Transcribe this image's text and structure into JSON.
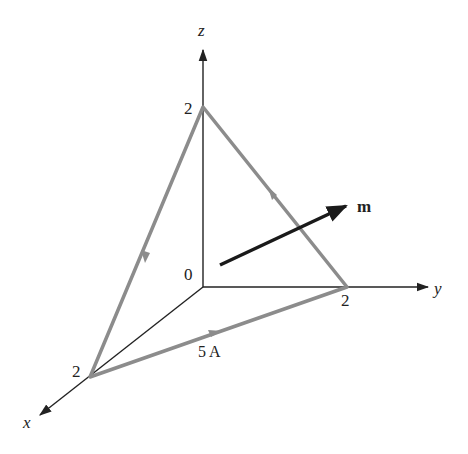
{
  "diagram": {
    "type": "3d-axes-triangular-current-loop",
    "axes": {
      "x": {
        "label": "x",
        "tick": "2"
      },
      "y": {
        "label": "y",
        "tick": "2"
      },
      "z": {
        "label": "z",
        "tick": "2"
      },
      "origin_label": "0"
    },
    "loop": {
      "vertices": [
        "(2,0,0)",
        "(0,2,0)",
        "(0,0,2)"
      ],
      "current_label": "5 A",
      "color": "#8c8c8c"
    },
    "moment": {
      "label": "m",
      "color": "#1a1a1a"
    },
    "axis_color": "#222222"
  }
}
